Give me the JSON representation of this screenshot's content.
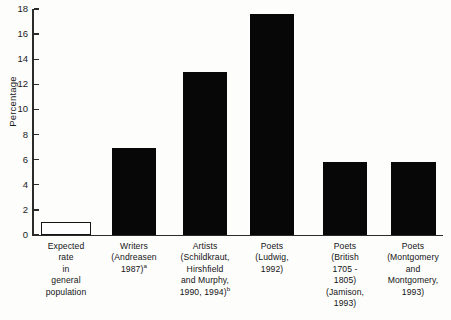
{
  "chart_data": {
    "type": "bar",
    "title": "",
    "subtitle": "",
    "xlabel": "",
    "ylabel": "Percentage",
    "ylim": [
      0,
      18
    ],
    "ytick_step": 2,
    "yticks": [
      0,
      2,
      4,
      6,
      8,
      10,
      12,
      14,
      16,
      18
    ],
    "grid": false,
    "legend": false,
    "categories": [
      "Expected rate in general population",
      "Writers (Andreasen 1987)a",
      "Artists (Schildkraut, Hirshfield and Murphy, 1990, 1994)b",
      "Poets (Ludwig, 1992)",
      "Poets (British 1705 - 1805) (Jamison, 1993)",
      "Poets (Montgomery and Montgomery, 1993)"
    ],
    "values": [
      1.0,
      6.9,
      13.0,
      17.6,
      5.8,
      5.8
    ],
    "bar_styles": [
      "hollow",
      "filled",
      "filled",
      "filled",
      "filled",
      "filled"
    ],
    "colors": {
      "bar_fill": "#070707",
      "bar_hollow_fill": "#ffffff",
      "bar_hollow_stroke": "#141414",
      "axis": "#2b2b2b",
      "text": "#141414",
      "background": "#fdfdfc"
    }
  },
  "axis": {
    "y_title": "Percentage",
    "tick_labels": [
      "0",
      "2",
      "4",
      "6",
      "8",
      "10",
      "12",
      "14",
      "16",
      "18"
    ]
  },
  "category_labels": [
    {
      "lines": [
        "Expected",
        "rate",
        "in",
        "general",
        "population"
      ],
      "superscript": ""
    },
    {
      "lines": [
        "Writers",
        "(Andreasen",
        "1987)"
      ],
      "superscript": "a"
    },
    {
      "lines": [
        "Artists",
        "(Schildkraut,",
        "Hirshfield",
        "and Murphy,",
        "1990, 1994)"
      ],
      "superscript": "b"
    },
    {
      "lines": [
        "Poets",
        "(Ludwig,",
        "1992)"
      ],
      "superscript": ""
    },
    {
      "lines": [
        "Poets",
        "(British",
        "1705 -",
        "1805)",
        "(Jamison,",
        "1993)"
      ],
      "superscript": ""
    },
    {
      "lines": [
        "Poets",
        "(Montgomery",
        "and",
        "Montgomery,",
        "1993)"
      ],
      "superscript": ""
    }
  ]
}
